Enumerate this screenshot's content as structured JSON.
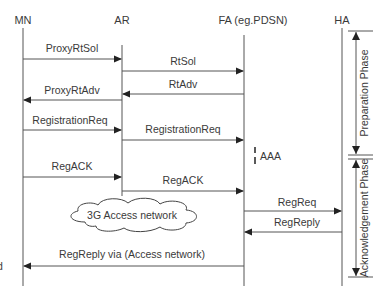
{
  "entities": [
    {
      "id": "mn",
      "label": "MN"
    },
    {
      "id": "ar",
      "label": "AR"
    },
    {
      "id": "fa",
      "label": "FA (eg.PDSN)"
    },
    {
      "id": "ha",
      "label": "HA"
    }
  ],
  "messages": [
    {
      "label": "ProxyRtSol",
      "from": "mn",
      "to": "ar"
    },
    {
      "label": "RtSol",
      "from": "ar",
      "to": "fa"
    },
    {
      "label": "RtAdv",
      "from": "fa",
      "to": "ar"
    },
    {
      "label": "ProxyRtAdv",
      "from": "ar",
      "to": "mn"
    },
    {
      "label": "RegistrationReq",
      "from": "mn",
      "to": "ar"
    },
    {
      "label": "RegistrationReq",
      "from": "ar",
      "to": "fa"
    },
    {
      "label": "RegACK",
      "from": "mn",
      "to": "ar"
    },
    {
      "label": "RegACK",
      "from": "ar",
      "to": "fa"
    },
    {
      "label": "RegReq",
      "from": "fa",
      "to": "ha"
    },
    {
      "label": "RegReply",
      "from": "ha",
      "to": "fa"
    },
    {
      "label": "RegReply via (Access network)",
      "from": "fa",
      "to": "mn"
    }
  ],
  "aaa_label": "AAA",
  "cloud_label": "3G Access network",
  "phases": [
    {
      "label": "Preparation Phase"
    },
    {
      "label": "Acknowledgement Phase"
    }
  ],
  "edge_fragment": "d"
}
